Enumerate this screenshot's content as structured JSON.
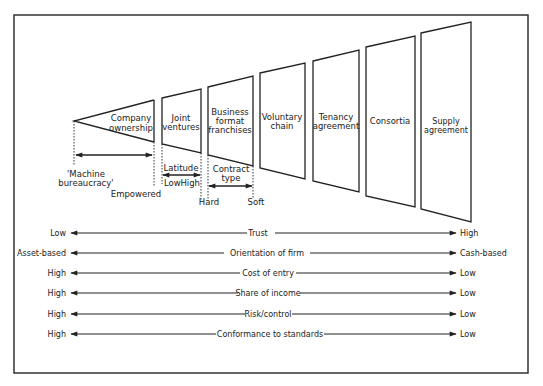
{
  "diagram": {
    "apex_label": "'Machine bureaucracy'",
    "apex_lines": [
      "'Machine",
      "bureaucracy'"
    ],
    "empowered_label": "Empowered",
    "latitude": {
      "label": "Latitude",
      "low": "Low",
      "high": "High"
    },
    "contract_type": {
      "label_lines": [
        "Contract",
        "type"
      ],
      "hard": "Hard",
      "soft": "Soft"
    },
    "forms": [
      {
        "name": "Company ownership",
        "lines": [
          "Company",
          "ownership"
        ]
      },
      {
        "name": "Joint ventures",
        "lines": [
          "Joint",
          "ventures"
        ]
      },
      {
        "name": "Business format franchises",
        "lines": [
          "Business",
          "format",
          "franchises"
        ]
      },
      {
        "name": "Voluntary chain",
        "lines": [
          "Voluntary",
          "chain"
        ]
      },
      {
        "name": "Tenancy agreement",
        "lines": [
          "Tenancy",
          "agreement"
        ]
      },
      {
        "name": "Consortia",
        "lines": [
          "Consortia"
        ]
      },
      {
        "name": "Supply agreement",
        "lines": [
          "Supply",
          "agreement"
        ]
      }
    ],
    "scales": [
      {
        "name": "Trust",
        "left": "Low",
        "right": "High"
      },
      {
        "name": "Orientation of firm",
        "left": "Asset-based",
        "right": "Cash-based"
      },
      {
        "name": "Cost of entry",
        "left": "High",
        "right": "Low"
      },
      {
        "name": "Share of income",
        "left": "High",
        "right": "Low"
      },
      {
        "name": "Risk/control",
        "left": "High",
        "right": "Low"
      },
      {
        "name": "Conformance to standards",
        "left": "High",
        "right": "Low"
      }
    ]
  }
}
